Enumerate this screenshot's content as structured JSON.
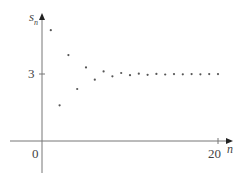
{
  "chart_data": {
    "type": "scatter",
    "title": "",
    "xlabel": "n",
    "ylabel": "s_n",
    "x_ticks": [
      "0",
      "20"
    ],
    "y_ticks": [
      "3"
    ],
    "xlim": [
      0,
      21
    ],
    "ylim": [
      -1.4,
      5.7
    ],
    "grid": false,
    "legend": null,
    "x": [
      1,
      2,
      3,
      4,
      5,
      6,
      7,
      8,
      9,
      10,
      11,
      12,
      13,
      14,
      15,
      16,
      17,
      18,
      19,
      20
    ],
    "values": [
      4.97,
      1.6,
      3.85,
      2.33,
      3.3,
      2.75,
      3.12,
      2.9,
      3.05,
      2.95,
      3.02,
      2.97,
      3.01,
      2.98,
      3.0,
      2.99,
      3.0,
      2.99,
      3.0,
      3.0
    ],
    "annotations": [
      "sequence converges to 3"
    ]
  },
  "labels": {
    "y_axis": "s",
    "y_axis_sub": "n",
    "x_axis": "n",
    "origin": "0",
    "y_tick": "3",
    "x_tick": "20"
  },
  "colors": {
    "axis": "#777777",
    "points": "#555555",
    "text": "#444444"
  }
}
